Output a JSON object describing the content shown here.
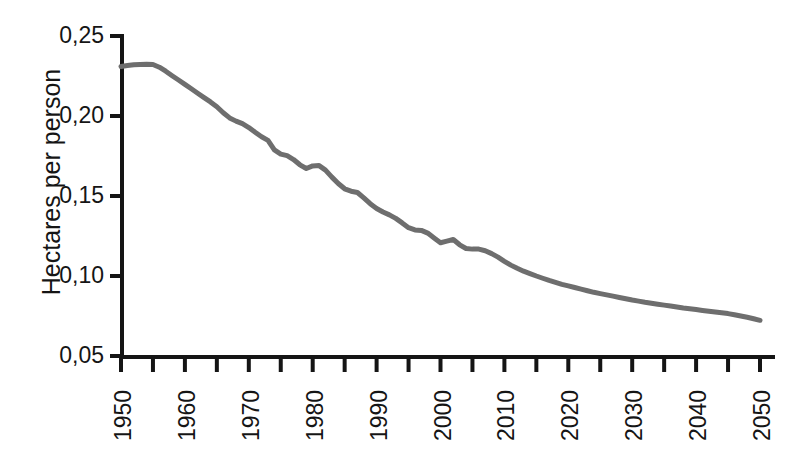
{
  "chart_data": {
    "type": "line",
    "title": "",
    "xlabel": "",
    "ylabel": "Hectares per person",
    "xlim": [
      1950,
      2050
    ],
    "ylim": [
      0.05,
      0.25
    ],
    "grid": false,
    "legend": null,
    "line_color": "#6e6e6e",
    "axis_color": "#151515",
    "decimal_separator": ",",
    "y_ticks": [
      {
        "value": 0.25,
        "label": "0,25"
      },
      {
        "value": 0.2,
        "label": "0,20"
      },
      {
        "value": 0.15,
        "label": "0,15"
      },
      {
        "value": 0.1,
        "label": "0,10"
      },
      {
        "value": 0.05,
        "label": "0,05"
      }
    ],
    "x_ticks_major": [
      {
        "value": 1950,
        "label": "1950"
      },
      {
        "value": 1960,
        "label": "1960"
      },
      {
        "value": 1970,
        "label": "1970"
      },
      {
        "value": 1980,
        "label": "1980"
      },
      {
        "value": 1990,
        "label": "1990"
      },
      {
        "value": 2000,
        "label": "2000"
      },
      {
        "value": 2010,
        "label": "2010"
      },
      {
        "value": 2020,
        "label": "2020"
      },
      {
        "value": 2030,
        "label": "2030"
      },
      {
        "value": 2040,
        "label": "2040"
      },
      {
        "value": 2050,
        "label": "2050"
      }
    ],
    "x_ticks_minor": [
      1955,
      1965,
      1975,
      1985,
      1995,
      2005,
      2015,
      2025,
      2035,
      2045
    ],
    "x": [
      1950,
      1951,
      1952,
      1953,
      1954,
      1955,
      1956,
      1957,
      1958,
      1959,
      1960,
      1961,
      1962,
      1963,
      1964,
      1965,
      1966,
      1967,
      1968,
      1969,
      1970,
      1971,
      1972,
      1973,
      1974,
      1975,
      1976,
      1977,
      1978,
      1979,
      1980,
      1981,
      1982,
      1983,
      1984,
      1985,
      1986,
      1987,
      1988,
      1989,
      1990,
      1991,
      1992,
      1993,
      1994,
      1995,
      1996,
      1997,
      1998,
      1999,
      2000,
      2001,
      2002,
      2003,
      2004,
      2005,
      2006,
      2007,
      2008,
      2009,
      2010,
      2011,
      2012,
      2013,
      2014,
      2015,
      2016,
      2017,
      2018,
      2019,
      2020,
      2021,
      2022,
      2023,
      2024,
      2025,
      2026,
      2027,
      2028,
      2029,
      2030,
      2031,
      2032,
      2033,
      2034,
      2035,
      2036,
      2037,
      2038,
      2039,
      2040,
      2041,
      2042,
      2043,
      2044,
      2045,
      2046,
      2047,
      2048,
      2049,
      2050
    ],
    "y": [
      0.231,
      0.2315,
      0.232,
      0.2322,
      0.2323,
      0.2322,
      0.2305,
      0.228,
      0.2252,
      0.2225,
      0.2198,
      0.217,
      0.2142,
      0.2115,
      0.2088,
      0.2058,
      0.202,
      0.1988,
      0.1968,
      0.1952,
      0.1928,
      0.1898,
      0.187,
      0.1848,
      0.1788,
      0.1762,
      0.1752,
      0.1728,
      0.1695,
      0.1672,
      0.1688,
      0.169,
      0.1662,
      0.1618,
      0.1578,
      0.1545,
      0.153,
      0.1522,
      0.1488,
      0.1452,
      0.1422,
      0.14,
      0.1382,
      0.136,
      0.1332,
      0.1302,
      0.1288,
      0.1285,
      0.1268,
      0.1238,
      0.1208,
      0.1218,
      0.1228,
      0.1195,
      0.1172,
      0.1168,
      0.1168,
      0.1158,
      0.114,
      0.1118,
      0.1092,
      0.1068,
      0.1048,
      0.103,
      0.1015,
      0.1,
      0.0986,
      0.0972,
      0.096,
      0.0948,
      0.0938,
      0.0928,
      0.0918,
      0.0908,
      0.0898,
      0.089,
      0.0882,
      0.0874,
      0.0866,
      0.0858,
      0.085,
      0.0843,
      0.0836,
      0.083,
      0.0824,
      0.0818,
      0.0812,
      0.0806,
      0.08,
      0.0795,
      0.079,
      0.0785,
      0.078,
      0.0775,
      0.077,
      0.0765,
      0.0758,
      0.075,
      0.0742,
      0.0733,
      0.0723
    ],
    "notes": {
      "peak_year": 1955,
      "peak_value": 0.2323,
      "end_year": 2050,
      "end_value": 0.0723
    }
  }
}
